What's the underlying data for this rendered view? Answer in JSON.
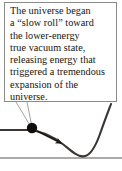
{
  "figure": {
    "name": "slow-roll-false-vacuum-diagram",
    "background_color": "#ffffff"
  },
  "callout": {
    "text": "The universe began\na “slow roll” toward\nthe lower-energy\ntrue vacuum state,\nreleasing energy that\ntriggered a tremendous\nexpansion of the\nuniverse.",
    "lines": [
      "The universe began",
      "a “slow roll” toward",
      "the lower-energy",
      "true vacuum state,",
      "releasing energy that",
      "triggered a tremendous",
      "expansion of the",
      "universe."
    ],
    "border_color": "#8a8a8a",
    "text_color": "#16130f",
    "background_color": "#ffffff"
  },
  "diagram": {
    "curve_color": "#3a3634",
    "baseline_color": "#5a5653",
    "ball_color": "#100d0b",
    "arrow_color": "#1a1715",
    "leader_color": "#9a9694",
    "ball_position": {
      "x": 32,
      "y": 128
    },
    "curve_minimum": {
      "x": 82,
      "y": 156
    },
    "baseline_y": 158,
    "plateau_y": 130,
    "arrow_start": {
      "x": 37,
      "y": 131
    },
    "arrow_end": {
      "x": 63,
      "y": 144
    }
  }
}
